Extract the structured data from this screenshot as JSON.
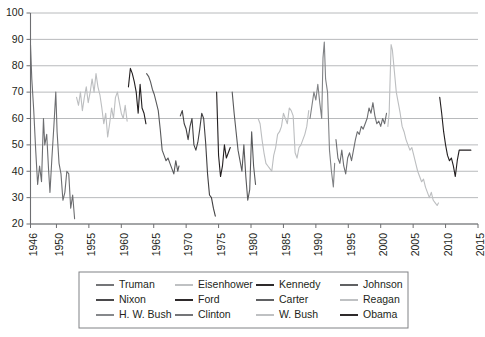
{
  "chart_data": {
    "type": "line",
    "title": "",
    "subtitle": "",
    "xlabel": "",
    "ylabel": "",
    "xlim": [
      1946,
      2015
    ],
    "ylim": [
      20,
      100
    ],
    "grid": true,
    "legend_position": "bottom",
    "y_ticks": [
      20,
      30,
      40,
      50,
      60,
      70,
      80,
      90,
      100
    ],
    "y_tick_labels": [
      "20",
      "30",
      "40",
      "50",
      "60",
      "70",
      "80",
      "90",
      "100"
    ],
    "x_ticks": [
      1946,
      1950,
      1955,
      1960,
      1965,
      1970,
      1975,
      1980,
      1985,
      1990,
      1995,
      2000,
      2005,
      2010,
      2015
    ],
    "x_tick_labels": [
      "1946",
      "1950",
      "1955",
      "1960",
      "1965",
      "1970",
      "1975",
      "1980",
      "1985",
      "1990",
      "1995",
      "2000",
      "2005",
      "2010",
      "2015"
    ],
    "series": [
      {
        "name": "Truman",
        "color": "#6d6e71",
        "x": [
          1946.0,
          1946.2,
          1946.5,
          1946.8,
          1947.1,
          1947.4,
          1947.7,
          1948.0,
          1948.2,
          1948.5,
          1948.8,
          1949.0,
          1949.3,
          1949.6,
          1949.9,
          1950.1,
          1950.4,
          1950.7,
          1951.0,
          1951.3,
          1951.6,
          1951.9,
          1952.2,
          1952.5,
          1952.8
        ],
        "y": [
          88,
          75,
          63,
          48,
          35,
          42,
          36,
          60,
          50,
          54,
          40,
          32,
          45,
          57,
          70,
          55,
          43,
          39,
          29,
          32,
          40,
          39,
          26,
          31,
          22
        ]
      },
      {
        "name": "Eisenhower",
        "color": "#bcbec0",
        "x": [
          1953.1,
          1953.4,
          1953.7,
          1954.0,
          1954.3,
          1954.6,
          1954.9,
          1955.2,
          1955.5,
          1955.8,
          1956.1,
          1956.4,
          1956.7,
          1957.0,
          1957.3,
          1957.6,
          1957.9,
          1958.2,
          1958.5,
          1958.8,
          1959.1,
          1959.4,
          1959.7,
          1960.0,
          1960.3,
          1960.6,
          1960.9
        ],
        "y": [
          68,
          65,
          70,
          63,
          68,
          72,
          66,
          70,
          75,
          70,
          77,
          72,
          69,
          64,
          58,
          62,
          53,
          58,
          64,
          60,
          68,
          70,
          66,
          62,
          60,
          65,
          59
        ]
      },
      {
        "name": "Kennedy",
        "color": "#231f20",
        "x": [
          1961.1,
          1961.4,
          1961.7,
          1962.0,
          1962.3,
          1962.6,
          1962.9,
          1963.2,
          1963.5,
          1963.8
        ],
        "y": [
          72,
          79,
          77,
          74,
          70,
          62,
          73,
          64,
          62,
          58
        ]
      },
      {
        "name": "Johnson",
        "color": "#58595b",
        "x": [
          1963.9,
          1964.2,
          1964.5,
          1964.8,
          1965.1,
          1965.4,
          1965.7,
          1966.0,
          1966.3,
          1966.6,
          1966.9,
          1967.2,
          1967.5,
          1967.8,
          1968.1,
          1968.4,
          1968.7,
          1968.9
        ],
        "y": [
          77,
          76,
          74,
          71,
          69,
          66,
          63,
          56,
          48,
          46,
          44,
          45,
          43,
          41,
          39,
          44,
          40,
          42
        ]
      },
      {
        "name": "Nixon",
        "color": "#414042",
        "x": [
          1969.1,
          1969.4,
          1969.7,
          1970.0,
          1970.3,
          1970.6,
          1970.9,
          1971.2,
          1971.5,
          1971.8,
          1972.1,
          1972.4,
          1972.7,
          1973.0,
          1973.3,
          1973.6,
          1973.9,
          1974.2,
          1974.5
        ],
        "y": [
          61,
          63,
          58,
          56,
          52,
          57,
          60,
          50,
          48,
          51,
          56,
          62,
          60,
          51,
          39,
          31,
          30,
          26,
          23
        ]
      },
      {
        "name": "Ford",
        "color": "#231f20",
        "x": [
          1974.7,
          1975.0,
          1975.3,
          1975.6,
          1975.9,
          1976.2,
          1976.5,
          1976.8
        ],
        "y": [
          70,
          46,
          38,
          42,
          50,
          45,
          47,
          49
        ]
      },
      {
        "name": "Carter",
        "color": "#58595b",
        "x": [
          1977.1,
          1977.4,
          1977.7,
          1978.0,
          1978.3,
          1978.6,
          1978.9,
          1979.2,
          1979.5,
          1979.8,
          1980.1,
          1980.4,
          1980.7
        ],
        "y": [
          70,
          62,
          55,
          48,
          44,
          40,
          50,
          38,
          29,
          33,
          55,
          42,
          35
        ]
      },
      {
        "name": "Reagan",
        "color": "#bcbec0",
        "x": [
          1981.1,
          1981.4,
          1981.7,
          1982.0,
          1982.3,
          1982.6,
          1982.9,
          1983.2,
          1983.5,
          1983.8,
          1984.1,
          1984.4,
          1984.7,
          1985.0,
          1985.3,
          1985.6,
          1985.9,
          1986.2,
          1986.5,
          1986.8,
          1987.1,
          1987.4,
          1987.7,
          1988.0,
          1988.3,
          1988.6,
          1988.9
        ],
        "y": [
          60,
          58,
          52,
          47,
          43,
          42,
          41,
          40,
          46,
          49,
          54,
          55,
          57,
          62,
          60,
          58,
          64,
          63,
          61,
          47,
          45,
          49,
          50,
          52,
          54,
          57,
          63
        ]
      },
      {
        "name": "H. W. Bush",
        "color": "#808285",
        "x": [
          1989.1,
          1989.4,
          1989.7,
          1990.0,
          1990.3,
          1990.6,
          1990.9,
          1991.1,
          1991.3,
          1991.5,
          1991.8,
          1992.1,
          1992.4,
          1992.7,
          1992.9
        ],
        "y": [
          60,
          65,
          70,
          67,
          73,
          66,
          60,
          83,
          89,
          75,
          70,
          48,
          40,
          34,
          43
        ]
      },
      {
        "name": "Clinton",
        "color": "#6d6e71",
        "x": [
          1993.1,
          1993.4,
          1993.7,
          1994.0,
          1994.3,
          1994.6,
          1994.9,
          1995.2,
          1995.5,
          1995.8,
          1996.1,
          1996.4,
          1996.7,
          1997.0,
          1997.3,
          1997.6,
          1997.9,
          1998.2,
          1998.5,
          1998.8,
          1999.1,
          1999.4,
          1999.7,
          2000.0,
          2000.3,
          2000.6,
          2000.9
        ],
        "y": [
          52,
          45,
          43,
          48,
          42,
          39,
          45,
          47,
          44,
          48,
          52,
          55,
          54,
          57,
          56,
          58,
          60,
          64,
          62,
          66,
          61,
          58,
          59,
          57,
          60,
          58,
          62
        ]
      },
      {
        "name": "W. Bush",
        "color": "#bcbec0",
        "x": [
          2001.1,
          2001.3,
          2001.6,
          2001.8,
          2002.1,
          2002.4,
          2002.7,
          2003.0,
          2003.3,
          2003.6,
          2003.9,
          2004.2,
          2004.5,
          2004.8,
          2005.1,
          2005.4,
          2005.7,
          2006.0,
          2006.3,
          2006.6,
          2006.9,
          2007.2,
          2007.5,
          2007.8,
          2008.1,
          2008.4,
          2008.7,
          2008.9
        ],
        "y": [
          57,
          62,
          88,
          86,
          78,
          70,
          66,
          62,
          57,
          55,
          52,
          50,
          48,
          49,
          46,
          43,
          40,
          38,
          36,
          37,
          34,
          32,
          30,
          32,
          29,
          28,
          27,
          28
        ]
      },
      {
        "name": "Obama",
        "color": "#231f20",
        "x": [
          2009.1,
          2009.4,
          2009.7,
          2010.0,
          2010.3,
          2010.6,
          2010.9,
          2011.2,
          2011.5,
          2011.8,
          2012.1,
          2012.4,
          2012.7,
          2013.0,
          2013.3,
          2013.6,
          2013.9
        ],
        "y": [
          68,
          62,
          55,
          50,
          46,
          44,
          45,
          42,
          38,
          44,
          48,
          48,
          48,
          48,
          48,
          48,
          48
        ]
      }
    ]
  },
  "legend": {
    "rows": [
      [
        {
          "label": "Truman",
          "color": "#6d6e71"
        },
        {
          "label": "Eisenhower",
          "color": "#bcbec0"
        },
        {
          "label": "Kennedy",
          "color": "#231f20"
        },
        {
          "label": "Johnson",
          "color": "#58595b"
        }
      ],
      [
        {
          "label": "Nixon",
          "color": "#414042"
        },
        {
          "label": "Ford",
          "color": "#231f20"
        },
        {
          "label": "Carter",
          "color": "#58595b"
        },
        {
          "label": "Reagan",
          "color": "#bcbec0"
        }
      ],
      [
        {
          "label": "H. W. Bush",
          "color": "#808285"
        },
        {
          "label": "Clinton",
          "color": "#6d6e71"
        },
        {
          "label": "W. Bush",
          "color": "#bcbec0"
        },
        {
          "label": "Obama",
          "color": "#231f20"
        }
      ]
    ]
  },
  "style": {
    "gridline_color": "#a6a8ab",
    "axis_color": "#6d6e71",
    "legend_border_color": "#808285",
    "text_color": "#231f20",
    "background": "#ffffff"
  }
}
